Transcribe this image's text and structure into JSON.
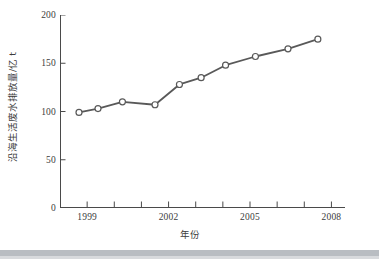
{
  "chart_data": {
    "type": "line",
    "title": "",
    "xlabel": "年份",
    "ylabel": "沿海生活废水排放量/亿 t",
    "xlim": [
      1998,
      2008.5
    ],
    "ylim": [
      0,
      200
    ],
    "xticks": [
      1999,
      2002,
      2005,
      2008
    ],
    "xtick_labels": [
      "1999",
      "2002",
      "2005",
      "2008"
    ],
    "yticks": [
      0,
      50,
      100,
      150,
      200
    ],
    "ytick_labels": [
      "0",
      "50",
      "100",
      "150",
      "200"
    ],
    "grid": false,
    "legend": "none",
    "marker": "open-circle",
    "line_color": "#595959",
    "marker_edge_color": "#595959",
    "marker_face_color": "#ffffff",
    "series": [
      {
        "name": "沿海生活废水排放量",
        "x": [
          1998.7,
          1999.4,
          2000.3,
          2001.5,
          2002.4,
          2003.2,
          2004.1,
          2005.2,
          2006.4,
          2007.5
        ],
        "values": [
          99,
          103,
          110,
          107,
          128,
          135,
          148,
          157,
          165,
          175
        ]
      }
    ]
  },
  "figure": {
    "background_color": "#ffffff",
    "axis_color": "#4a4a4a",
    "band_color": "#b9bdc2"
  }
}
